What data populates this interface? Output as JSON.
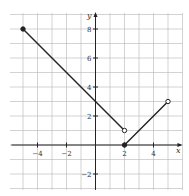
{
  "chart_data": {
    "type": "line",
    "title": "",
    "xlabel": "x",
    "ylabel": "y",
    "xlim": [
      -6,
      6
    ],
    "ylim": [
      -3,
      9
    ],
    "grid": true,
    "x_ticks": [
      -4,
      -2,
      2,
      4
    ],
    "y_ticks": [
      -2,
      2,
      4,
      6,
      8
    ],
    "x_tick_labels": [
      "−4",
      "−2",
      "2",
      "4"
    ],
    "y_tick_labels": [
      "−2",
      "2",
      "4",
      "6",
      "8"
    ],
    "series": [
      {
        "name": "segment 1",
        "points": [
          [
            -5,
            8
          ],
          [
            2,
            1
          ]
        ],
        "endpoints": [
          "closed",
          "open"
        ]
      },
      {
        "name": "segment 2",
        "points": [
          [
            2,
            0
          ],
          [
            5,
            3
          ]
        ],
        "endpoints": [
          "closed",
          "open"
        ]
      }
    ]
  }
}
